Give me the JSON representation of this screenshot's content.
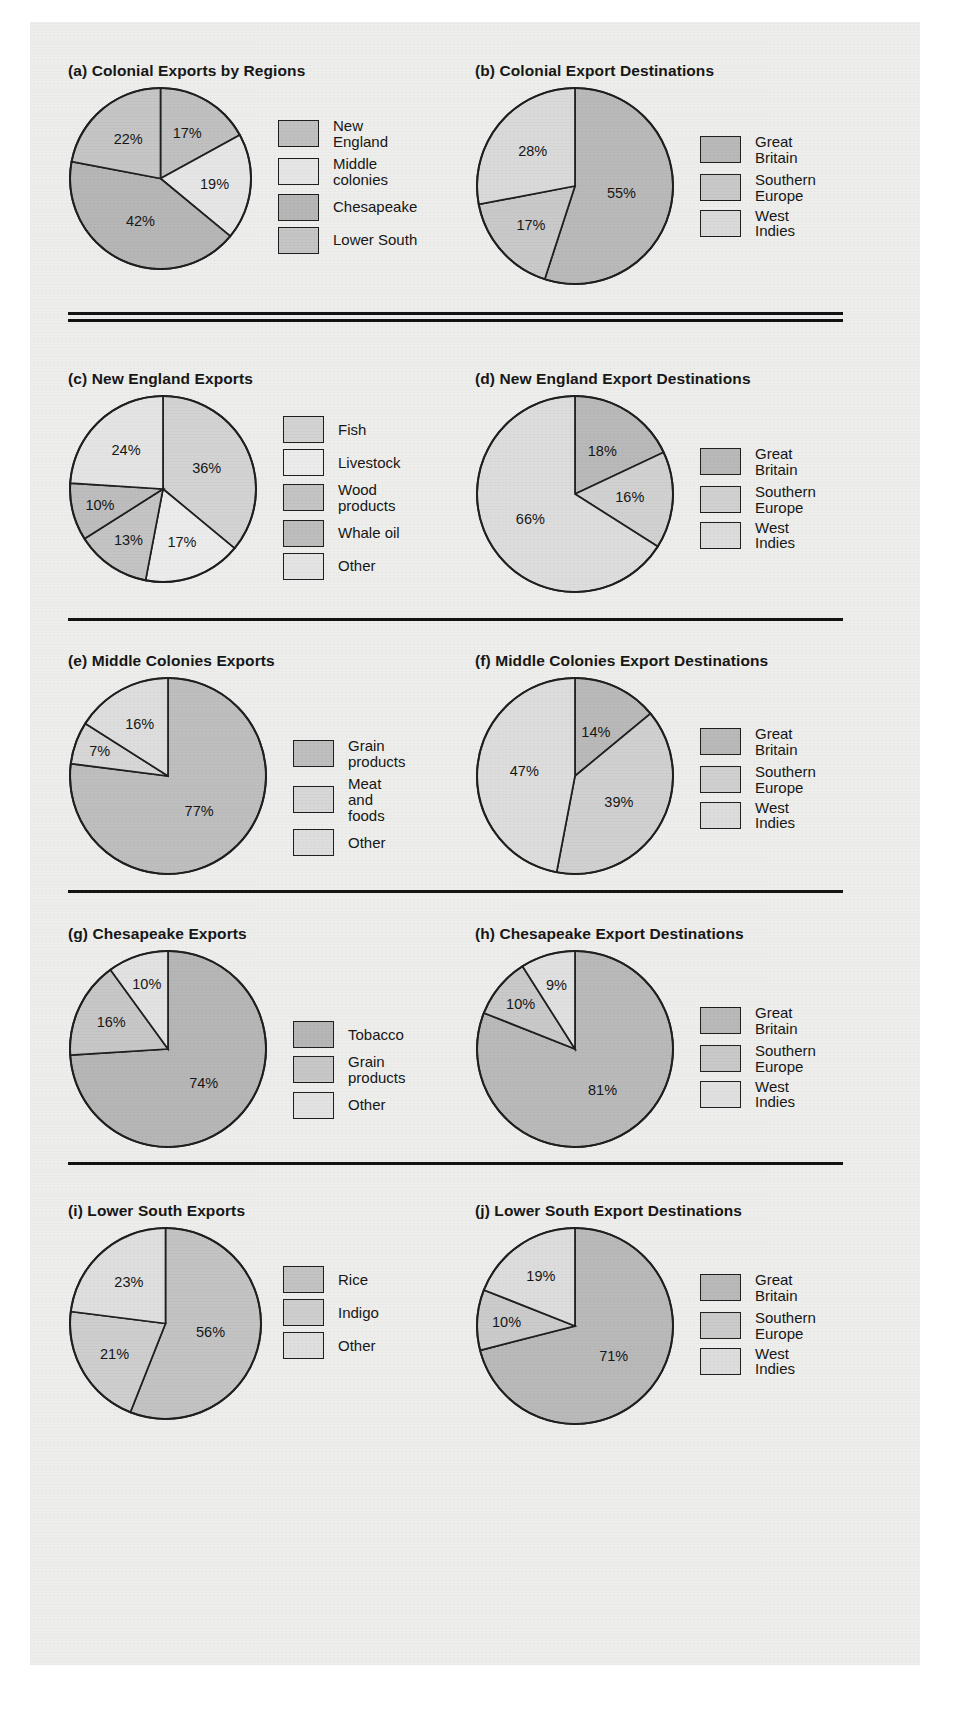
{
  "figure": {
    "palette": {
      "dark": "#a8a8a8",
      "mid": "#bfbfbf",
      "light": "#d8d8d8",
      "pale": "#e6e6e6",
      "outline": "#1a1a1a",
      "page_bg": "#eeeeec"
    },
    "separators": [
      {
        "name": "separator-double-1",
        "style": "double"
      },
      {
        "name": "separator-2",
        "style": "single"
      },
      {
        "name": "separator-3",
        "style": "single"
      },
      {
        "name": "separator-4",
        "style": "single"
      }
    ]
  },
  "chart_data": [
    {
      "id": "a",
      "type": "pie",
      "title": "(a) Colonial Exports by Regions",
      "categories": [
        "New England",
        "Middle colonies",
        "Chesapeake",
        "Lower South"
      ],
      "values": [
        17,
        19,
        42,
        22
      ],
      "labels": [
        "17%",
        "19%",
        "42%",
        "22%"
      ],
      "colors": [
        "#bfbfbf",
        "#e6e6e6",
        "#b5b5b5",
        "#c4c4c4"
      ],
      "legend_position": "right",
      "startangle_deg": 0
    },
    {
      "id": "b",
      "type": "pie",
      "title": "(b) Colonial Export Destinations",
      "categories": [
        "Great Britain",
        "Southern Europe",
        "West Indies"
      ],
      "values": [
        55,
        17,
        28
      ],
      "labels": [
        "55%",
        "17%",
        "28%"
      ],
      "colors": [
        "#b8b8b8",
        "#c8c8c8",
        "#d9d9d9"
      ],
      "legend_position": "right",
      "startangle_deg": 0
    },
    {
      "id": "c",
      "type": "pie",
      "title": "(c) New England Exports",
      "categories": [
        "Fish",
        "Livestock",
        "Wood products",
        "Whale oil",
        "Other"
      ],
      "values": [
        36,
        17,
        13,
        10,
        24
      ],
      "labels": [
        "36%",
        "17%",
        "13%",
        "10%",
        "24%"
      ],
      "colors": [
        "#d2d2d2",
        "#ececec",
        "#c3c3c3",
        "#bcbcbc",
        "#e4e4e4"
      ],
      "legend_position": "right",
      "startangle_deg": 0
    },
    {
      "id": "d",
      "type": "pie",
      "title": "(d) New England Export Destinations",
      "categories": [
        "Great Britain",
        "Southern Europe",
        "West Indies"
      ],
      "values": [
        18,
        16,
        66
      ],
      "labels": [
        "18%",
        "16%",
        "66%"
      ],
      "colors": [
        "#b8b8b8",
        "#d0d0d0",
        "#dcdcdc"
      ],
      "legend_position": "right",
      "startangle_deg": 0
    },
    {
      "id": "e",
      "type": "pie",
      "title": "(e) Middle Colonies Exports",
      "categories": [
        "Grain products",
        "Meat and foods",
        "Other"
      ],
      "values": [
        77,
        7,
        16
      ],
      "labels": [
        "77%",
        "7%",
        "16%"
      ],
      "colors": [
        "#bdbdbd",
        "#d6d6d6",
        "#dddddd"
      ],
      "legend_position": "right",
      "startangle_deg": 0
    },
    {
      "id": "f",
      "type": "pie",
      "title": "(f) Middle Colonies Export Destinations",
      "categories": [
        "Great Britain",
        "Southern Europe",
        "West Indies"
      ],
      "values": [
        14,
        39,
        47
      ],
      "labels": [
        "14%",
        "39%",
        "47%"
      ],
      "colors": [
        "#b8b8b8",
        "#cfcfcf",
        "#dcdcdc"
      ],
      "legend_position": "right",
      "startangle_deg": 0
    },
    {
      "id": "g",
      "type": "pie",
      "title": "(g) Chesapeake Exports",
      "categories": [
        "Tobacco",
        "Grain products",
        "Other"
      ],
      "values": [
        74,
        16,
        10
      ],
      "labels": [
        "74%",
        "16%",
        "10%"
      ],
      "colors": [
        "#b5b5b5",
        "#c6c6c6",
        "#e2e2e2"
      ],
      "legend_position": "right",
      "startangle_deg": 0
    },
    {
      "id": "h",
      "type": "pie",
      "title": "(h) Chesapeake Export Destinations",
      "categories": [
        "Great Britain",
        "Southern Europe",
        "West Indies"
      ],
      "values": [
        81,
        10,
        9
      ],
      "labels": [
        "81%",
        "10%",
        "9%"
      ],
      "colors": [
        "#b8b8b8",
        "#c8c8c8",
        "#e0e0e0"
      ],
      "legend_position": "right",
      "startangle_deg": 0
    },
    {
      "id": "i",
      "type": "pie",
      "title": "(i) Lower South Exports",
      "categories": [
        "Rice",
        "Indigo",
        "Other"
      ],
      "values": [
        56,
        21,
        23
      ],
      "labels": [
        "56%",
        "21%",
        "23%"
      ],
      "colors": [
        "#c2c2c2",
        "#cdcdcd",
        "#dedede"
      ],
      "legend_position": "right",
      "startangle_deg": 0
    },
    {
      "id": "j",
      "type": "pie",
      "title": "(j) Lower South Export Destinations",
      "categories": [
        "Great Britain",
        "Southern Europe",
        "West Indies"
      ],
      "values": [
        71,
        10,
        19
      ],
      "labels": [
        "71%",
        "10%",
        "19%"
      ],
      "colors": [
        "#b8b8b8",
        "#cacaca",
        "#dcdcdc"
      ],
      "legend_position": "right",
      "startangle_deg": 0
    }
  ]
}
